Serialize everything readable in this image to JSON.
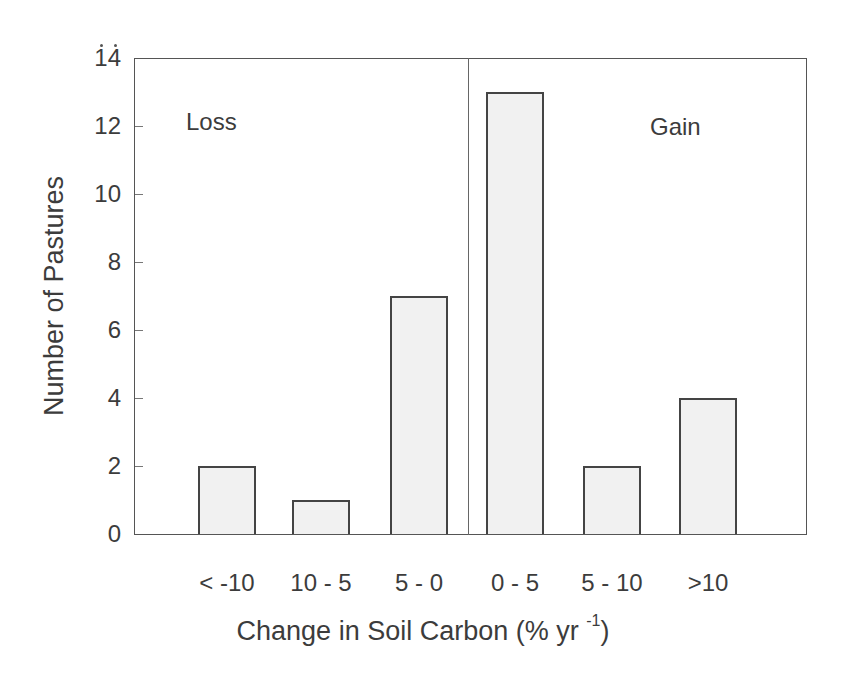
{
  "chart_data": {
    "type": "bar",
    "title": "",
    "categories": [
      "< -10",
      "10 - 5",
      "5 - 0",
      "0 - 5",
      "5 - 10",
      ">10"
    ],
    "values": [
      2,
      1,
      7,
      13,
      2,
      4
    ],
    "xlabel": "Change in Soil Carbon (% yr -1)",
    "xlabel_main": "Change in Soil Carbon (% yr ",
    "xlabel_sup": "-1",
    "xlabel_end": ")",
    "ylabel": "Number of Pastures",
    "ylim": [
      0,
      14
    ],
    "yticks": [
      "0",
      "2",
      "4",
      "6",
      "8",
      "10",
      "12",
      "14"
    ],
    "grid": false,
    "annotations": [
      {
        "text": "Loss",
        "region": "left of divider (categories < -10 to 5 - 0)"
      },
      {
        "text": "Gain",
        "region": "right of divider (categories 0 - 5 to >10)"
      }
    ],
    "divider_between": [
      "5 - 0",
      "0 - 5"
    ],
    "bar_color": "#f1f1f1",
    "edge_color": "#444444"
  },
  "labels": {
    "loss": "Loss",
    "gain": "Gain"
  }
}
